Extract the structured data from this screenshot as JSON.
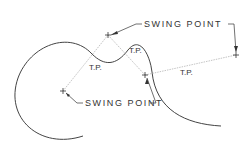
{
  "diagram": {
    "type": "curve tangent construction",
    "labels": {
      "swing_point_top": "SWING POINT",
      "swing_point_bottom": "SWING POINT",
      "tangent_points": [
        "T.P.",
        "T.P.",
        "T.P."
      ]
    },
    "colors": {
      "curve": "#444444",
      "construction_line": "#aaaaaa",
      "text": "#333333",
      "background": "#ffffff"
    }
  }
}
